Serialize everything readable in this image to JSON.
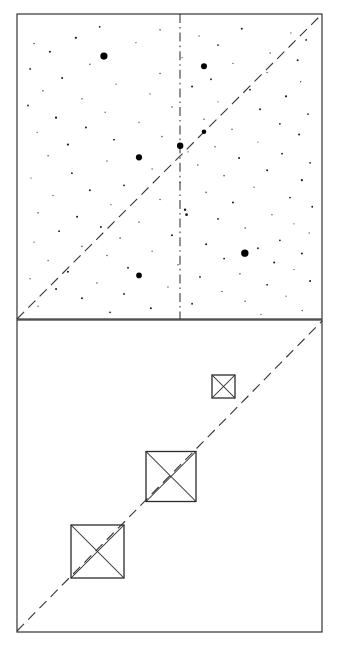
{
  "figure": {
    "background_color": "#ffffff",
    "line_color": "#2b2b2b",
    "dot_color": "#000000",
    "width": 339,
    "height": 647,
    "panel_count": 2
  },
  "chart_data": {
    "type": "scatter",
    "title": "",
    "subtitle": "",
    "xlabel": "",
    "ylabel": "",
    "grid": false,
    "legend": null,
    "panels": [
      {
        "name": "upper-panel-scatter",
        "type": "scatter",
        "frame": {
          "x": 17,
          "y": 14,
          "width": 305,
          "height": 305
        },
        "xlim": [
          0,
          1
        ],
        "ylim": [
          0,
          1
        ],
        "annotations": [
          {
            "name": "diagonal-identity-line",
            "type": "dashed-line",
            "from": [
              0,
              0
            ],
            "to": [
              1,
              1
            ],
            "style": "dashed"
          },
          {
            "name": "vertical-center-line",
            "type": "dash-dot-line",
            "x": 0.535,
            "from_y": 0,
            "to_y": 1,
            "style": "dash-dot"
          }
        ],
        "major_points": [
          {
            "x": 0.285,
            "y": 0.862,
            "r": 3.6
          },
          {
            "x": 0.613,
            "y": 0.829,
            "r": 3.0
          },
          {
            "x": 0.4,
            "y": 0.53,
            "r": 3.1
          },
          {
            "x": 0.535,
            "y": 0.568,
            "r": 3.2
          },
          {
            "x": 0.613,
            "y": 0.614,
            "r": 2.3
          },
          {
            "x": 0.747,
            "y": 0.216,
            "r": 3.7
          },
          {
            "x": 0.4,
            "y": 0.143,
            "r": 2.8
          }
        ],
        "minor_points": [
          {
            "x": 0.271,
            "y": 0.958,
            "r": 0.9
          },
          {
            "x": 0.469,
            "y": 0.948,
            "r": 0.8
          },
          {
            "x": 0.737,
            "y": 0.952,
            "r": 1.0
          },
          {
            "x": 0.898,
            "y": 0.938,
            "r": 0.7
          },
          {
            "x": 0.193,
            "y": 0.922,
            "r": 1.1
          },
          {
            "x": 0.597,
            "y": 0.928,
            "r": 0.7
          },
          {
            "x": 0.948,
            "y": 0.915,
            "r": 0.9
          },
          {
            "x": 0.056,
            "y": 0.903,
            "r": 0.8
          },
          {
            "x": 0.39,
            "y": 0.906,
            "r": 0.7
          },
          {
            "x": 0.659,
            "y": 0.898,
            "r": 0.9
          },
          {
            "x": 0.108,
            "y": 0.876,
            "r": 1.0
          },
          {
            "x": 0.83,
            "y": 0.872,
            "r": 0.8
          },
          {
            "x": 0.541,
            "y": 0.857,
            "r": 0.7
          },
          {
            "x": 0.92,
            "y": 0.848,
            "r": 1.0
          },
          {
            "x": 0.239,
            "y": 0.835,
            "r": 0.8
          },
          {
            "x": 0.708,
            "y": 0.838,
            "r": 0.7
          },
          {
            "x": 0.043,
            "y": 0.82,
            "r": 0.9
          },
          {
            "x": 0.469,
            "y": 0.805,
            "r": 0.8
          },
          {
            "x": 0.82,
            "y": 0.808,
            "r": 0.7
          },
          {
            "x": 0.148,
            "y": 0.79,
            "r": 1.0
          },
          {
            "x": 0.636,
            "y": 0.786,
            "r": 0.9
          },
          {
            "x": 0.93,
            "y": 0.778,
            "r": 0.8
          },
          {
            "x": 0.325,
            "y": 0.77,
            "r": 0.7
          },
          {
            "x": 0.574,
            "y": 0.762,
            "r": 1.0
          },
          {
            "x": 0.085,
            "y": 0.748,
            "r": 0.8
          },
          {
            "x": 0.764,
            "y": 0.752,
            "r": 0.9
          },
          {
            "x": 0.436,
            "y": 0.738,
            "r": 0.7
          },
          {
            "x": 0.882,
            "y": 0.73,
            "r": 1.1
          },
          {
            "x": 0.213,
            "y": 0.722,
            "r": 0.8
          },
          {
            "x": 0.659,
            "y": 0.712,
            "r": 0.7
          },
          {
            "x": 0.036,
            "y": 0.7,
            "r": 0.9
          },
          {
            "x": 0.508,
            "y": 0.695,
            "r": 0.8
          },
          {
            "x": 0.797,
            "y": 0.688,
            "r": 1.0
          },
          {
            "x": 0.289,
            "y": 0.678,
            "r": 0.7
          },
          {
            "x": 0.954,
            "y": 0.672,
            "r": 0.9
          },
          {
            "x": 0.128,
            "y": 0.66,
            "r": 1.1
          },
          {
            "x": 0.613,
            "y": 0.655,
            "r": 0.8
          },
          {
            "x": 0.4,
            "y": 0.645,
            "r": 0.7
          },
          {
            "x": 0.862,
            "y": 0.64,
            "r": 0.9
          },
          {
            "x": 0.226,
            "y": 0.628,
            "r": 1.0
          },
          {
            "x": 0.705,
            "y": 0.622,
            "r": 0.8
          },
          {
            "x": 0.066,
            "y": 0.612,
            "r": 0.7
          },
          {
            "x": 0.925,
            "y": 0.605,
            "r": 1.0
          },
          {
            "x": 0.475,
            "y": 0.598,
            "r": 0.8
          },
          {
            "x": 0.318,
            "y": 0.588,
            "r": 0.9
          },
          {
            "x": 0.79,
            "y": 0.58,
            "r": 0.7
          },
          {
            "x": 0.167,
            "y": 0.572,
            "r": 1.1
          },
          {
            "x": 0.649,
            "y": 0.565,
            "r": 0.8
          },
          {
            "x": 0.561,
            "y": 0.548,
            "r": 0.7
          },
          {
            "x": 0.869,
            "y": 0.542,
            "r": 0.9
          },
          {
            "x": 0.102,
            "y": 0.535,
            "r": 0.8
          },
          {
            "x": 0.728,
            "y": 0.528,
            "r": 1.0
          },
          {
            "x": 0.295,
            "y": 0.518,
            "r": 0.7
          },
          {
            "x": 0.961,
            "y": 0.512,
            "r": 0.9
          },
          {
            "x": 0.593,
            "y": 0.505,
            "r": 0.8
          },
          {
            "x": 0.443,
            "y": 0.492,
            "r": 0.7
          },
          {
            "x": 0.82,
            "y": 0.488,
            "r": 1.0
          },
          {
            "x": 0.18,
            "y": 0.478,
            "r": 0.9
          },
          {
            "x": 0.679,
            "y": 0.47,
            "r": 0.8
          },
          {
            "x": 0.046,
            "y": 0.462,
            "r": 0.7
          },
          {
            "x": 0.934,
            "y": 0.455,
            "r": 1.1
          },
          {
            "x": 0.535,
            "y": 0.448,
            "r": 0.8
          },
          {
            "x": 0.351,
            "y": 0.438,
            "r": 0.9
          },
          {
            "x": 0.777,
            "y": 0.432,
            "r": 0.7
          },
          {
            "x": 0.239,
            "y": 0.422,
            "r": 1.0
          },
          {
            "x": 0.62,
            "y": 0.415,
            "r": 0.8
          },
          {
            "x": 0.118,
            "y": 0.405,
            "r": 0.7
          },
          {
            "x": 0.895,
            "y": 0.398,
            "r": 0.9
          },
          {
            "x": 0.469,
            "y": 0.392,
            "r": 0.8
          },
          {
            "x": 0.708,
            "y": 0.382,
            "r": 1.0
          },
          {
            "x": 0.308,
            "y": 0.375,
            "r": 0.7
          },
          {
            "x": 0.968,
            "y": 0.368,
            "r": 0.9
          },
          {
            "x": 0.551,
            "y": 0.358,
            "r": 1.2
          },
          {
            "x": 0.556,
            "y": 0.342,
            "r": 1.4
          },
          {
            "x": 0.069,
            "y": 0.348,
            "r": 0.8
          },
          {
            "x": 0.836,
            "y": 0.342,
            "r": 0.7
          },
          {
            "x": 0.197,
            "y": 0.335,
            "r": 1.0
          },
          {
            "x": 0.659,
            "y": 0.328,
            "r": 0.9
          },
          {
            "x": 0.4,
            "y": 0.318,
            "r": 0.8
          },
          {
            "x": 0.908,
            "y": 0.312,
            "r": 0.7
          },
          {
            "x": 0.275,
            "y": 0.302,
            "r": 1.0
          },
          {
            "x": 0.748,
            "y": 0.298,
            "r": 0.8
          },
          {
            "x": 0.138,
            "y": 0.288,
            "r": 0.9
          },
          {
            "x": 0.958,
            "y": 0.282,
            "r": 0.7
          },
          {
            "x": 0.508,
            "y": 0.275,
            "r": 1.0
          },
          {
            "x": 0.338,
            "y": 0.265,
            "r": 0.8
          },
          {
            "x": 0.862,
            "y": 0.258,
            "r": 0.9
          },
          {
            "x": 0.056,
            "y": 0.252,
            "r": 0.7
          },
          {
            "x": 0.62,
            "y": 0.245,
            "r": 1.0
          },
          {
            "x": 0.213,
            "y": 0.238,
            "r": 0.8
          },
          {
            "x": 0.79,
            "y": 0.232,
            "r": 0.9
          },
          {
            "x": 0.443,
            "y": 0.222,
            "r": 0.7
          },
          {
            "x": 0.934,
            "y": 0.215,
            "r": 1.0
          },
          {
            "x": 0.295,
            "y": 0.208,
            "r": 0.8
          },
          {
            "x": 0.679,
            "y": 0.198,
            "r": 0.9
          },
          {
            "x": 0.102,
            "y": 0.192,
            "r": 0.7
          },
          {
            "x": 0.843,
            "y": 0.185,
            "r": 1.0
          },
          {
            "x": 0.528,
            "y": 0.178,
            "r": 0.8
          },
          {
            "x": 0.364,
            "y": 0.168,
            "r": 0.9
          },
          {
            "x": 0.908,
            "y": 0.162,
            "r": 0.7
          },
          {
            "x": 0.167,
            "y": 0.155,
            "r": 1.0
          },
          {
            "x": 0.731,
            "y": 0.148,
            "r": 0.8
          },
          {
            "x": 0.6,
            "y": 0.138,
            "r": 0.9
          },
          {
            "x": 0.043,
            "y": 0.132,
            "r": 0.7
          },
          {
            "x": 0.961,
            "y": 0.125,
            "r": 1.0
          },
          {
            "x": 0.262,
            "y": 0.118,
            "r": 0.8
          },
          {
            "x": 0.82,
            "y": 0.112,
            "r": 0.9
          },
          {
            "x": 0.495,
            "y": 0.105,
            "r": 0.7
          },
          {
            "x": 0.128,
            "y": 0.098,
            "r": 1.0
          },
          {
            "x": 0.672,
            "y": 0.09,
            "r": 0.8
          },
          {
            "x": 0.351,
            "y": 0.082,
            "r": 0.9
          },
          {
            "x": 0.882,
            "y": 0.075,
            "r": 0.7
          },
          {
            "x": 0.213,
            "y": 0.068,
            "r": 1.0
          },
          {
            "x": 0.748,
            "y": 0.058,
            "r": 0.8
          },
          {
            "x": 0.574,
            "y": 0.05,
            "r": 0.9
          },
          {
            "x": 0.069,
            "y": 0.042,
            "r": 0.7
          },
          {
            "x": 0.439,
            "y": 0.035,
            "r": 1.0
          },
          {
            "x": 0.935,
            "y": 0.028,
            "r": 0.8
          },
          {
            "x": 0.305,
            "y": 0.022,
            "r": 0.9
          },
          {
            "x": 0.8,
            "y": 0.015,
            "r": 0.7
          }
        ]
      },
      {
        "name": "lower-panel-squares",
        "type": "diagram",
        "frame": {
          "x": 17,
          "y": 320,
          "width": 305,
          "height": 312
        },
        "annotations": [
          {
            "name": "diagonal-identity-line",
            "type": "dashed-line",
            "from": [
              0,
              0
            ],
            "to": [
              1,
              1
            ],
            "style": "dashed"
          }
        ],
        "squares": [
          {
            "name": "large-square",
            "cx": 97.5,
            "cy": 551.5,
            "size": 53
          },
          {
            "name": "medium-square",
            "cx": 171,
            "cy": 476.5,
            "size": 50
          },
          {
            "name": "small-square",
            "cx": 223.5,
            "cy": 386.5,
            "size": 23
          }
        ]
      }
    ]
  }
}
